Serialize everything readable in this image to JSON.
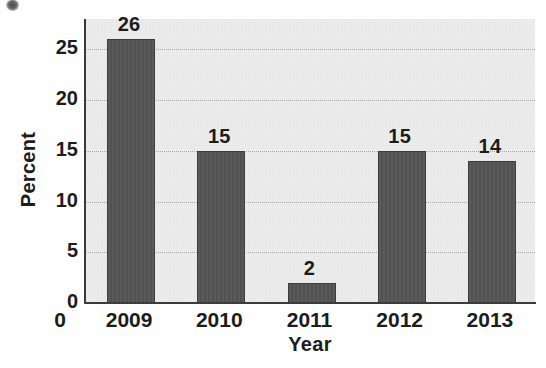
{
  "chart_data": {
    "type": "bar",
    "title": "",
    "subtitle": "",
    "xlabel": "Year",
    "ylabel": "Percent",
    "categories": [
      "2009",
      "2010",
      "2011",
      "2012",
      "2013"
    ],
    "values": [
      26,
      15,
      2,
      15,
      14
    ],
    "data_labels": [
      "26",
      "15",
      "2",
      "15",
      "14"
    ],
    "ylim": [
      0,
      28
    ],
    "yticks": [
      0,
      5,
      10,
      15,
      20,
      25
    ],
    "ytick_labels": [
      "0",
      "5",
      "10",
      "15",
      "20",
      "25"
    ],
    "grid": "horizontal-dotted",
    "legend": "none",
    "series": [
      {
        "name": "Percent",
        "values": [
          26,
          15,
          2,
          15,
          14
        ]
      }
    ],
    "bar_color": "#545454",
    "plot_background": "#ededed",
    "axis_color": "#3b3b3b",
    "gridline_color": "#a9a9a9",
    "text_color": "#1c1c1c"
  },
  "artifacts": {
    "smudge_label": "scan-smudge"
  }
}
